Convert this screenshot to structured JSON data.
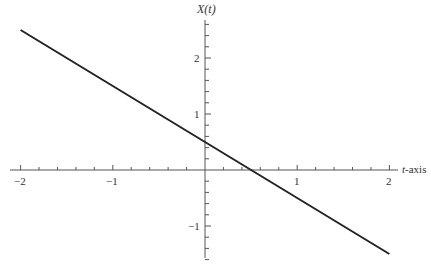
{
  "chart_data": {
    "type": "line",
    "title": "",
    "xlabel": "t-axis",
    "ylabel": "X(t)",
    "xlim": [
      -2.1,
      2.1
    ],
    "ylim": [
      -1.6,
      2.7
    ],
    "x_ticks": [
      -2,
      -1,
      1,
      2
    ],
    "x_tick_labels": [
      "−2",
      "−1",
      "1",
      "2"
    ],
    "y_ticks": [
      -1,
      1,
      2
    ],
    "y_tick_labels": [
      "−1",
      "1",
      "2"
    ],
    "minor_tick_step": 0.2,
    "grid": false,
    "legend": null,
    "series": [
      {
        "name": "X(t) = 0.5 - t",
        "x": [
          -2,
          -1,
          0,
          0.5,
          1,
          2
        ],
        "y": [
          2.5,
          1.5,
          0.5,
          0,
          -0.5,
          -1.5
        ]
      }
    ]
  },
  "labels": {
    "y_axis": "X(t)",
    "x_axis_var": "t",
    "x_axis_suffix": "-axis",
    "x_ticks": [
      "−2",
      "−1",
      "1",
      "2"
    ],
    "y_ticks": [
      "2",
      "1",
      "−1"
    ]
  }
}
